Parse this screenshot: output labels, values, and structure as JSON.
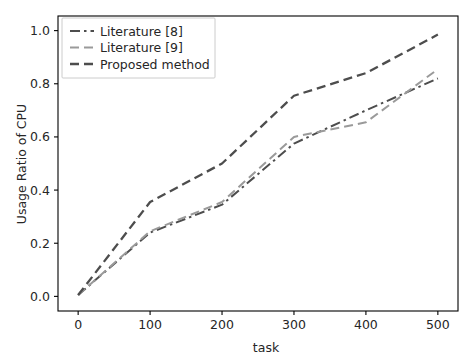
{
  "chart_data": {
    "type": "line",
    "title": "",
    "xlabel": "task",
    "ylabel": "Usage Ratio of CPU",
    "x": [
      0,
      100,
      200,
      300,
      400,
      500
    ],
    "xlim": [
      -28,
      528
    ],
    "ylim": [
      -0.055,
      1.055
    ],
    "xticks": [
      0,
      100,
      200,
      300,
      400,
      500
    ],
    "xtick_labels": [
      "0",
      "100",
      "200",
      "300",
      "400",
      "500"
    ],
    "yticks": [
      0.0,
      0.2,
      0.4,
      0.6,
      0.8,
      1.0
    ],
    "ytick_labels": [
      "0.0",
      "0.2",
      "0.4",
      "0.6",
      "0.8",
      "1.0"
    ],
    "grid": false,
    "legend_position": "upper left",
    "series": [
      {
        "name": "Literature [8]",
        "values": [
          0.005,
          0.24,
          0.345,
          0.575,
          0.7,
          0.82
        ],
        "color": "#4d4d4d",
        "linestyle": "dashdot",
        "dasharray": "10,4,2.5,4",
        "width": 2.0
      },
      {
        "name": "Literature [9]",
        "values": [
          0.005,
          0.245,
          0.355,
          0.6,
          0.655,
          0.855
        ],
        "color": "#9a9a9a",
        "linestyle": "dashed",
        "dasharray": "9,5",
        "width": 2.0
      },
      {
        "name": "Proposed method",
        "values": [
          0.005,
          0.355,
          0.5,
          0.755,
          0.84,
          0.985
        ],
        "color": "#4d4d4d",
        "linestyle": "dashed",
        "dasharray": "9,5",
        "width": 2.3
      }
    ]
  },
  "legend": {
    "entries": [
      {
        "label": "Literature [8]"
      },
      {
        "label": "Literature [9]"
      },
      {
        "label": "Proposed method"
      }
    ]
  },
  "axes": {
    "x_title": "task",
    "y_title": "Usage Ratio of CPU"
  },
  "colors": {
    "background": "#ffffff",
    "axis": "#000000",
    "text": "#262626",
    "series_dark": "#4d4d4d",
    "series_light": "#9a9a9a",
    "legend_border": "#cccccc"
  }
}
